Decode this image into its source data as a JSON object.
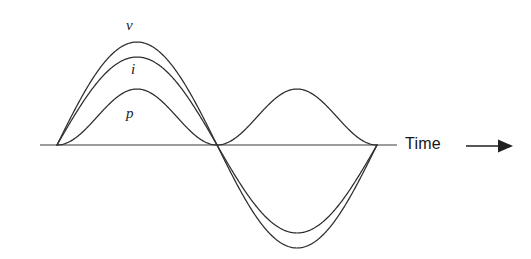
{
  "figure": {
    "background_color": "#ffffff",
    "line_color": "#2e2e2e"
  },
  "axis": {
    "time_label": "Time",
    "arrow_icon": "right-arrow-icon",
    "baseline_start_x": 40,
    "baseline_end_x": 397,
    "baseline_y": 145
  },
  "labels": {
    "v": "v",
    "i": "i",
    "p": "p"
  },
  "chart_data": {
    "type": "line",
    "xlabel": "Time",
    "ylabel": "",
    "grid": false,
    "legend": "inline-curve-labels",
    "x_domain": [
      0,
      1
    ],
    "x_description": "One full cycle of the AC waveform, from 0 to 2π radians",
    "y_domain": [
      -1.05,
      1.05
    ],
    "axis_ranges": {
      "x_pixels": [
        57,
        377
      ],
      "y_zero_pixel": 145
    },
    "series": [
      {
        "name": "v",
        "label": "v",
        "description": "Voltage, sinusoid, one full cycle, peak amplitude 1.0",
        "function": "sin",
        "amplitude": 1.0,
        "cycles": 1,
        "phase": 0,
        "peak_positive": 1.0,
        "peak_negative": -1.0,
        "peak_positive_pixel_y": 42,
        "peak_negative_pixel_y": 246,
        "x": [
          0,
          0.0625,
          0.125,
          0.1875,
          0.25,
          0.3125,
          0.375,
          0.4375,
          0.5,
          0.5625,
          0.625,
          0.6875,
          0.75,
          0.8125,
          0.875,
          0.9375,
          1
        ],
        "values": [
          0,
          0.383,
          0.707,
          0.924,
          1.0,
          0.924,
          0.707,
          0.383,
          0,
          -0.383,
          -0.707,
          -0.924,
          -1.0,
          -0.924,
          -0.707,
          -0.383,
          0
        ]
      },
      {
        "name": "i",
        "label": "i",
        "description": "Current, sinusoid in phase with voltage, peak amplitude 0.85",
        "function": "sin",
        "amplitude": 0.85,
        "cycles": 1,
        "phase": 0,
        "peak_positive": 0.85,
        "peak_negative": -0.85,
        "peak_positive_pixel_y": 57,
        "peak_negative_pixel_y": 232,
        "x": [
          0,
          0.0625,
          0.125,
          0.1875,
          0.25,
          0.3125,
          0.375,
          0.4375,
          0.5,
          0.5625,
          0.625,
          0.6875,
          0.75,
          0.8125,
          0.875,
          0.9375,
          1
        ],
        "values": [
          0,
          0.325,
          0.601,
          0.785,
          0.85,
          0.785,
          0.601,
          0.325,
          0,
          -0.325,
          -0.601,
          -0.785,
          -0.85,
          -0.785,
          -0.601,
          -0.325,
          0
        ]
      },
      {
        "name": "p",
        "label": "p",
        "description": "Instantaneous power, product of v and i, always positive, double frequency, peak amplitude 0.56",
        "function": "sin^2",
        "amplitude": 0.56,
        "cycles": 2,
        "phase": 0,
        "peak_positive": 0.56,
        "peak_negative": 0,
        "peak_positive_pixel_y": 89,
        "x": [
          0,
          0.0625,
          0.125,
          0.1875,
          0.25,
          0.3125,
          0.375,
          0.4375,
          0.5,
          0.5625,
          0.625,
          0.6875,
          0.75,
          0.8125,
          0.875,
          0.9375,
          1
        ],
        "values": [
          0,
          0.125,
          0.28,
          0.478,
          0.56,
          0.478,
          0.28,
          0.125,
          0,
          0.125,
          0.28,
          0.478,
          0.56,
          0.478,
          0.28,
          0.125,
          0
        ]
      }
    ]
  }
}
